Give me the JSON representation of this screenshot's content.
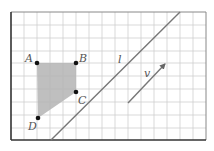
{
  "diagram": {
    "type": "grid-geometry",
    "grid": {
      "columns": 15,
      "rows": 10,
      "line_color": "#c8c8c8",
      "frame_color": "#555555"
    },
    "polygon": {
      "fill": "#b4b4b4",
      "vertices": [
        {
          "label": "A",
          "x": 37,
          "y": 63
        },
        {
          "label": "B",
          "x": 76,
          "y": 63
        },
        {
          "label": "C",
          "x": 76,
          "y": 92
        },
        {
          "label": "D",
          "x": 38,
          "y": 118
        }
      ]
    },
    "line": {
      "label": "l",
      "x1": 51,
      "y1": 140,
      "x2": 180,
      "y2": 12,
      "color": "#777777"
    },
    "vector": {
      "label": "v",
      "x1": 128,
      "y1": 103,
      "x2": 166,
      "y2": 63,
      "color": "#777777"
    }
  },
  "labels": {
    "A": "A",
    "B": "B",
    "C": "C",
    "D": "D",
    "l": "l",
    "v": "v"
  }
}
